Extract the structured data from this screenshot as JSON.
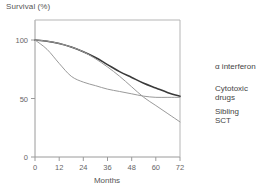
{
  "chart_data": {
    "type": "line",
    "title": "",
    "xlabel": "Months",
    "ylabel": "Survival (%)",
    "xlim": [
      0,
      72
    ],
    "ylim": [
      0,
      100
    ],
    "xticks": [
      0,
      12,
      24,
      36,
      48,
      60,
      72
    ],
    "yticks": [
      0,
      50,
      100
    ],
    "grid": false,
    "legend_position": "right",
    "x": [
      0,
      6,
      12,
      18,
      24,
      30,
      36,
      42,
      48,
      54,
      60,
      66,
      72
    ],
    "series": [
      {
        "name": "α interferon",
        "color": "#3a3a3a",
        "width": 1.6,
        "values": [
          100,
          99,
          97,
          94,
          90,
          85,
          79,
          73,
          68,
          63,
          59,
          55,
          52
        ]
      },
      {
        "name": "Cytotoxic drugs",
        "color": "#9a9a9a",
        "width": 1.0,
        "values": [
          100,
          92,
          80,
          69,
          64,
          61,
          58,
          56,
          54,
          52,
          51,
          51,
          51
        ]
      },
      {
        "name": "Sibling SCT",
        "color": "#9a9a9a",
        "width": 1.0,
        "values": [
          100,
          99,
          97,
          94,
          90,
          84,
          77,
          69,
          60,
          51,
          44,
          37,
          30
        ]
      }
    ]
  },
  "legend": {
    "items": [
      {
        "label": "α interferon",
        "label2": ""
      },
      {
        "label": "Cytotoxic",
        "label2": "drugs"
      },
      {
        "label": "Sibling",
        "label2": "SCT"
      }
    ]
  },
  "axes": {
    "ylabel_text": "Survival (%)",
    "xlabel_text": "Months",
    "xtick_0": "0",
    "xtick_1": "12",
    "xtick_2": "24",
    "xtick_3": "36",
    "xtick_4": "48",
    "xtick_5": "60",
    "xtick_6": "72",
    "ytick_0": "0",
    "ytick_1": "50",
    "ytick_2": "100"
  },
  "colors": {
    "series_dark": "#3a3a3a",
    "series_gray": "#9a9a9a",
    "axis": "#8c8c8c",
    "text": "#555555"
  }
}
